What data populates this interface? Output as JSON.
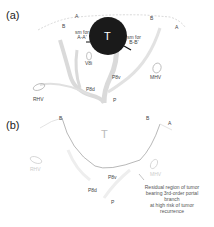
{
  "panels": [
    {
      "id": "a",
      "label": "(a)",
      "tumor_label": "T",
      "labels": {
        "b_left": "B",
        "a_left": "A",
        "b_right": "B",
        "a_right": "A",
        "sm_aa": "sm for A-A'",
        "sm_aa_line1": "sm for",
        "sm_aa_line2": "A-A'",
        "sm_bb_line1": "sm for",
        "sm_bb_line2": "B-B'",
        "v8i": "V8i",
        "rhv": "RHV",
        "mhv": "MHV",
        "p8d": "P8d",
        "p8v": "P8v",
        "p": "P"
      }
    },
    {
      "id": "b",
      "label": "(b)",
      "tumor_label": "T",
      "labels": {
        "b_left": "B",
        "b_right": "B",
        "a_right": "A",
        "p8d": "P8d",
        "p8v": "P8v",
        "p": "P",
        "rhv": "RHV",
        "mhv": "MHV"
      },
      "annotation": [
        "Residual region of tumor",
        "bearing 3rd-order portal",
        "branch",
        "at high risk of tumor",
        "recurrence"
      ]
    }
  ],
  "colors": {
    "tumor": "#1a1a1a",
    "vessel": "#d9d9d9",
    "outline": "#bbbbbb",
    "text": "#444444"
  }
}
